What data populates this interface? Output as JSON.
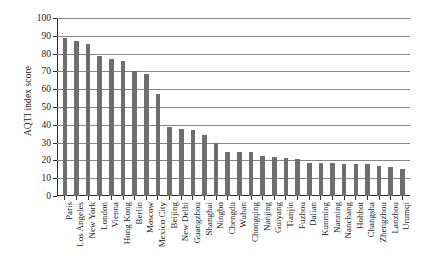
{
  "chart_data": {
    "type": "bar",
    "title": "",
    "xlabel": "",
    "ylabel": "AQTI index score",
    "ylim": [
      0,
      100
    ],
    "ytick_labels": [
      "0",
      "10",
      "20",
      "30",
      "40",
      "50",
      "60",
      "70",
      "80",
      "90",
      "100"
    ],
    "yticks": [
      0,
      10,
      20,
      30,
      40,
      50,
      60,
      70,
      80,
      90,
      100
    ],
    "grid": true,
    "legend": "none",
    "bar_color": "#6e6e6e",
    "categories": [
      "Paris",
      "Los Angeles",
      "New York",
      "London",
      "Vienna",
      "Hong Kong",
      "Berlin",
      "Moscow",
      "Mexico City",
      "Beijing",
      "New Delhi",
      "Guangzhou",
      "Shanghai",
      "Ningbo",
      "Chengdu",
      "Wuhan",
      "Chongqing",
      "Nanjing",
      "Guiyang",
      "Tianjin",
      "Fuzhou",
      "Dalian",
      "Kunming",
      "Nanning",
      "Nanchang",
      "Hohhot",
      "Changsha",
      "Zhengzhou",
      "Lanzhou",
      "Urumqi"
    ],
    "values": [
      89,
      87,
      85.5,
      78.5,
      77,
      76,
      70,
      68.5,
      57.5,
      38.5,
      37.5,
      37,
      34,
      30,
      25,
      25,
      24.5,
      22.5,
      22,
      21.5,
      21,
      18.5,
      18.5,
      18.5,
      18,
      18,
      18,
      17,
      16.5,
      15
    ]
  }
}
